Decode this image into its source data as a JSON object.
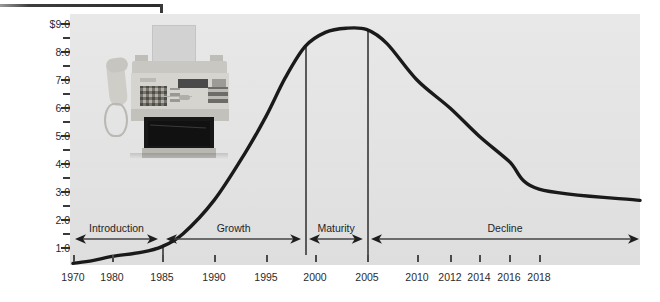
{
  "chart_data": {
    "type": "line",
    "title": "",
    "xlabel": "",
    "ylabel": "Worldwide sales ($ billions)",
    "grid": false,
    "legend": "none",
    "xlim": [
      1970,
      2019
    ],
    "ylim": [
      0.4,
      9.2
    ],
    "x_tick_labels": [
      "1970",
      "1980",
      "1985",
      "1990",
      "1995",
      "2000",
      "2005",
      "2010",
      "2012",
      "2014",
      "2016",
      "2018"
    ],
    "y_tick_labels": [
      "$9.0",
      "8.0",
      "7.0",
      "6.0",
      "5.0",
      "4.0",
      "3.0",
      "2.0",
      "1.0"
    ],
    "y_minor_ticks": [
      8.5,
      7.5,
      6.5,
      5.5,
      4.5,
      3.5,
      2.5,
      1.5
    ],
    "series": [
      {
        "name": "Worldwide fax machine sales",
        "x": [
          1970,
          1975,
          1980,
          1983,
          1985,
          1987,
          1990,
          1993,
          1995,
          1997,
          1999,
          2001,
          2003,
          2005,
          2007,
          2010,
          2012,
          2014,
          2016,
          2018,
          2019
        ],
        "values": [
          0.45,
          0.55,
          0.7,
          0.85,
          1.05,
          1.5,
          2.7,
          4.4,
          5.7,
          7.1,
          8.2,
          8.7,
          8.85,
          8.8,
          8.3,
          7.0,
          6.0,
          5.0,
          4.1,
          3.1,
          2.7
        ]
      }
    ],
    "stages": [
      {
        "name": "Introduction",
        "start_year": 1970,
        "end_year": 1985
      },
      {
        "name": "Growth",
        "start_year": 1985,
        "end_year": 1999
      },
      {
        "name": "Maturity",
        "start_year": 1999,
        "end_year": 2005
      },
      {
        "name": "Decline",
        "start_year": 2005,
        "end_year": 2019
      }
    ],
    "stage_dividers": [
      1985,
      1999,
      2005
    ],
    "annotations": [
      {
        "kind": "photo",
        "label": "fax-machine-photograph",
        "description": "Photograph of a desktop fax machine with handset and paper feed"
      }
    ],
    "colors": {
      "plot_background": "#e5e5e5",
      "curve": "#1a1a1a",
      "axis_text": "#2b2b2b",
      "divider": "#5a5a5a"
    }
  },
  "figure": {
    "y_axis_title": "Worldwide sales ($ billions)"
  }
}
